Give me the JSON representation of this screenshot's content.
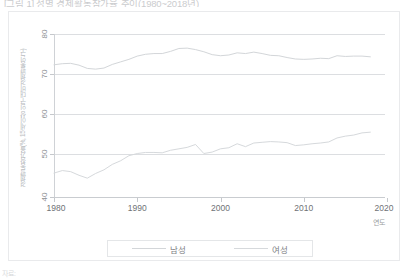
{
  "caption": {
    "top": "[그림 1] 성별 경제활동참가율 추이(1980~2018년)",
    "footnote": "자료:"
  },
  "axes": {
    "y_title": "경제활동참가율(%, 15세 이상 인구 대비 경제활동인구)",
    "x_title": "연도",
    "yticks": [
      "80",
      "70",
      "60",
      "50",
      "40"
    ],
    "xticks": [
      "1980",
      "1990",
      "2000",
      "2010",
      "2020"
    ]
  },
  "legend": {
    "position": "bottom",
    "items": [
      {
        "label": "남성",
        "color": "#d3d6d9"
      },
      {
        "label": "여성",
        "color": "#d6d9dc"
      }
    ]
  },
  "chart_data": {
    "type": "line",
    "title": "[그림 1] 성별 경제활동참가율 추이(1980~2018년)",
    "xlabel": "연도",
    "ylabel": "경제활동참가율(%, 15세 이상 인구 대비 경제활동인구)",
    "xlim": [
      1980,
      2020
    ],
    "ylim": [
      35,
      80
    ],
    "grid": true,
    "x": [
      1980,
      1981,
      1982,
      1983,
      1984,
      1985,
      1986,
      1987,
      1988,
      1989,
      1990,
      1991,
      1992,
      1993,
      1994,
      1995,
      1996,
      1997,
      1998,
      1999,
      2000,
      2001,
      2002,
      2003,
      2004,
      2005,
      2006,
      2007,
      2008,
      2009,
      2010,
      2011,
      2012,
      2013,
      2014,
      2015,
      2016,
      2017,
      2018
    ],
    "series": [
      {
        "name": "남성",
        "color": "#d3d6d9",
        "values": [
          71.5,
          71.8,
          71.9,
          71.4,
          70.5,
          70.3,
          70.6,
          71.6,
          72.3,
          73.0,
          73.9,
          74.4,
          74.6,
          74.6,
          75.2,
          76.0,
          76.1,
          75.7,
          75.1,
          74.3,
          74.0,
          74.2,
          74.8,
          74.6,
          75.0,
          74.6,
          74.1,
          74.0,
          73.5,
          73.1,
          73.0,
          73.1,
          73.3,
          73.2,
          74.0,
          73.8,
          73.9,
          73.9,
          73.7
        ]
      },
      {
        "name": "여성",
        "color": "#d6d9dc",
        "values": [
          41.6,
          42.3,
          42.0,
          41.0,
          40.2,
          41.5,
          42.5,
          44.0,
          45.0,
          46.4,
          47.0,
          47.3,
          47.3,
          47.2,
          47.9,
          48.3,
          48.7,
          49.5,
          47.0,
          47.4,
          48.3,
          48.6,
          49.7,
          48.9,
          49.9,
          50.1,
          50.3,
          50.2,
          50.0,
          49.2,
          49.4,
          49.7,
          49.9,
          50.2,
          51.3,
          51.8,
          52.1,
          52.7,
          52.9
        ]
      }
    ]
  }
}
